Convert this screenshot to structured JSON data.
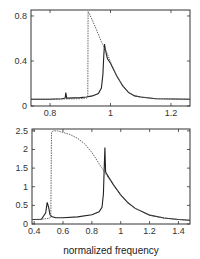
{
  "chart_data": [
    {
      "type": "line",
      "title": "",
      "xlabel": "",
      "ylabel": "",
      "xlim": [
        0.737,
        1.263
      ],
      "ylim": [
        0,
        0.853
      ],
      "xticks": [
        0.8,
        1,
        1.2
      ],
      "xtick_labels": [
        "0.8",
        "1",
        "1.2"
      ],
      "yticks": [
        0,
        0.4,
        0.8
      ],
      "ytick_labels": [
        "0",
        "0.4",
        "0.8"
      ],
      "grid": false,
      "series": [
        {
          "name": "solid",
          "style": "solid",
          "x": [
            0.737,
            0.78,
            0.8,
            0.84,
            0.85,
            0.852,
            0.855,
            0.86,
            0.9,
            0.92,
            0.94,
            0.96,
            0.97,
            0.975,
            0.978,
            0.98,
            0.983,
            0.987,
            0.99,
            1.0,
            1.02,
            1.04,
            1.06,
            1.08,
            1.1,
            1.15,
            1.263
          ],
          "y": [
            0.06,
            0.06,
            0.06,
            0.065,
            0.07,
            0.12,
            0.07,
            0.07,
            0.075,
            0.08,
            0.09,
            0.11,
            0.16,
            0.28,
            0.45,
            0.55,
            0.5,
            0.45,
            0.42,
            0.38,
            0.27,
            0.18,
            0.12,
            0.09,
            0.08,
            0.065,
            0.06
          ]
        },
        {
          "name": "dashed",
          "style": "dashed",
          "x": [
            0.737,
            0.8,
            0.9,
            0.92,
            0.925,
            0.926,
            0.93,
            0.95,
            0.97,
            0.99,
            1.0,
            1.02,
            1.04,
            1.06,
            1.08,
            1.1,
            1.15,
            1.263
          ],
          "y": [
            0.06,
            0.06,
            0.065,
            0.07,
            0.08,
            0.84,
            0.82,
            0.7,
            0.57,
            0.46,
            0.39,
            0.27,
            0.18,
            0.12,
            0.09,
            0.08,
            0.065,
            0.06
          ]
        }
      ]
    },
    {
      "type": "line",
      "title": "",
      "xlabel": "normalized frequency",
      "ylabel": "",
      "xlim": [
        0.385,
        1.48
      ],
      "ylim": [
        0,
        2.55
      ],
      "xticks": [
        0.4,
        0.6,
        0.8,
        1,
        1.2,
        1.4
      ],
      "xtick_labels": [
        "0.4",
        "0.6",
        "0.8",
        "1",
        "1.2",
        "1.4"
      ],
      "yticks": [
        0,
        0.5,
        1,
        1.5,
        2,
        2.5
      ],
      "ytick_labels": [
        "0",
        "0.5",
        "1",
        "1.5",
        "2",
        "2.5"
      ],
      "grid": false,
      "series": [
        {
          "name": "solid",
          "style": "solid",
          "x": [
            0.385,
            0.45,
            0.48,
            0.49,
            0.5,
            0.51,
            0.52,
            0.55,
            0.6,
            0.7,
            0.8,
            0.85,
            0.87,
            0.88,
            0.885,
            0.89,
            0.895,
            0.9,
            0.95,
            1.0,
            1.05,
            1.1,
            1.2,
            1.3,
            1.4,
            1.48
          ],
          "y": [
            0.12,
            0.13,
            0.3,
            0.58,
            0.45,
            0.25,
            0.2,
            0.17,
            0.17,
            0.19,
            0.25,
            0.33,
            0.45,
            0.8,
            1.4,
            2.05,
            1.4,
            1.36,
            1.05,
            0.78,
            0.57,
            0.42,
            0.24,
            0.16,
            0.12,
            0.1
          ]
        },
        {
          "name": "dashed",
          "style": "dashed",
          "x": [
            0.385,
            0.45,
            0.5,
            0.515,
            0.52,
            0.53,
            0.56,
            0.6,
            0.65,
            0.7,
            0.75,
            0.8,
            0.85,
            0.9,
            0.95,
            1.0,
            1.05,
            1.1,
            1.2,
            1.3,
            1.4,
            1.48
          ],
          "y": [
            0.12,
            0.13,
            0.15,
            0.18,
            2.45,
            2.5,
            2.5,
            2.46,
            2.4,
            2.3,
            2.15,
            1.92,
            1.62,
            1.32,
            1.05,
            0.78,
            0.57,
            0.42,
            0.24,
            0.16,
            0.12,
            0.1
          ]
        }
      ]
    }
  ]
}
